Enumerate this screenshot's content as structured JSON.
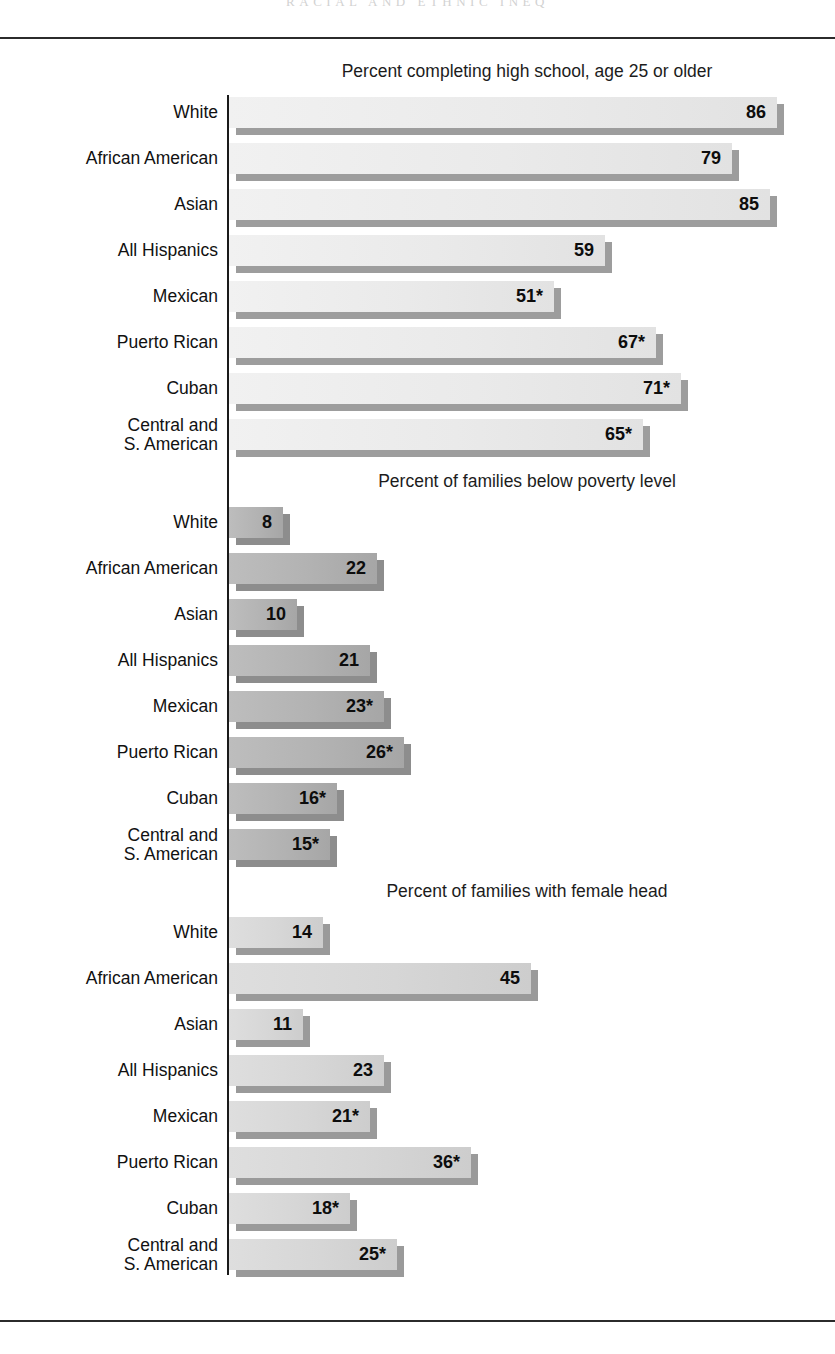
{
  "page": {
    "running_head": "RACIAL AND ETHNIC INEQ"
  },
  "chart_data": {
    "type": "bar",
    "orientation": "horizontal",
    "grid": false,
    "legend": false,
    "categories": [
      "White",
      "African American",
      "Asian",
      "All Hispanics",
      "Mexican",
      "Puerto Rican",
      "Cuban",
      "Central and S. American"
    ],
    "panels": [
      {
        "title": "Percent completing high school, age 25 or older",
        "xlabel": "",
        "ylabel": "",
        "xlim": [
          0,
          100
        ],
        "values": [
          86,
          79,
          85,
          59,
          51,
          67,
          71,
          65
        ],
        "labels": [
          "86",
          "79",
          "85",
          "59",
          "51*",
          "67*",
          "71*",
          "65*"
        ]
      },
      {
        "title": "Percent of families below poverty level",
        "xlabel": "",
        "ylabel": "",
        "xlim": [
          0,
          100
        ],
        "values": [
          8,
          22,
          10,
          21,
          23,
          26,
          16,
          15
        ],
        "labels": [
          "8",
          "22",
          "10",
          "21",
          "23*",
          "26*",
          "16*",
          "15*"
        ]
      },
      {
        "title": "Percent of families with female head",
        "xlabel": "",
        "ylabel": "",
        "xlim": [
          0,
          100
        ],
        "values": [
          14,
          45,
          11,
          23,
          21,
          36,
          18,
          25
        ],
        "labels": [
          "14",
          "45",
          "11",
          "23",
          "21*",
          "36*",
          "18*",
          "25*"
        ]
      }
    ]
  },
  "sections": [
    {
      "title": "Percent completing high school, age 25 or older",
      "rows": [
        {
          "label_line1": "White",
          "label_line2": "",
          "value": "86",
          "width": 548
        },
        {
          "label_line1": "African American",
          "label_line2": "",
          "value": "79",
          "width": 503
        },
        {
          "label_line1": "Asian",
          "label_line2": "",
          "value": "85",
          "width": 541
        },
        {
          "label_line1": "All Hispanics",
          "label_line2": "",
          "value": "59",
          "width": 376
        },
        {
          "label_line1": "Mexican",
          "label_line2": "",
          "value": "51*",
          "width": 325
        },
        {
          "label_line1": "Puerto Rican",
          "label_line2": "",
          "value": "67*",
          "width": 427
        },
        {
          "label_line1": "Cuban",
          "label_line2": "",
          "value": "71*",
          "width": 452
        },
        {
          "label_line1": "Central and",
          "label_line2": "S. American",
          "value": "65*",
          "width": 414
        }
      ]
    },
    {
      "title": "Percent of families below poverty level",
      "rows": [
        {
          "label_line1": "White",
          "label_line2": "",
          "value": "8",
          "width": 54
        },
        {
          "label_line1": "African American",
          "label_line2": "",
          "value": "22",
          "width": 148
        },
        {
          "label_line1": "Asian",
          "label_line2": "",
          "value": "10",
          "width": 68
        },
        {
          "label_line1": "All Hispanics",
          "label_line2": "",
          "value": "21",
          "width": 141
        },
        {
          "label_line1": "Mexican",
          "label_line2": "",
          "value": "23*",
          "width": 155
        },
        {
          "label_line1": "Puerto Rican",
          "label_line2": "",
          "value": "26*",
          "width": 175
        },
        {
          "label_line1": "Cuban",
          "label_line2": "",
          "value": "16*",
          "width": 108
        },
        {
          "label_line1": "Central and",
          "label_line2": "S. American",
          "value": "15*",
          "width": 101
        }
      ]
    },
    {
      "title": "Percent of families with female head",
      "rows": [
        {
          "label_line1": "White",
          "label_line2": "",
          "value": "14",
          "width": 94
        },
        {
          "label_line1": "African American",
          "label_line2": "",
          "value": "45",
          "width": 302
        },
        {
          "label_line1": "Asian",
          "label_line2": "",
          "value": "11",
          "width": 74
        },
        {
          "label_line1": "All Hispanics",
          "label_line2": "",
          "value": "23",
          "width": 155
        },
        {
          "label_line1": "Mexican",
          "label_line2": "",
          "value": "21*",
          "width": 141
        },
        {
          "label_line1": "Puerto Rican",
          "label_line2": "",
          "value": "36*",
          "width": 242
        },
        {
          "label_line1": "Cuban",
          "label_line2": "",
          "value": "18*",
          "width": 121
        },
        {
          "label_line1": "Central and",
          "label_line2": "S. American",
          "value": "25*",
          "width": 168
        }
      ]
    }
  ]
}
